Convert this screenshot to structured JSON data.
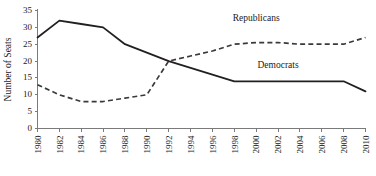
{
  "chart_data": {
    "type": "line",
    "title": "",
    "xlabel": "",
    "ylabel": "Number of Seats",
    "ylim": [
      0,
      35
    ],
    "ytick_step": 5,
    "yticks": [
      "0",
      "5",
      "10",
      "15",
      "20",
      "25",
      "30",
      "35"
    ],
    "grid": false,
    "legend_position": "inline-annotation",
    "categories": [
      "1980",
      "1982",
      "1984",
      "1986",
      "1988",
      "1990",
      "1992",
      "1994",
      "1996",
      "1998",
      "2000",
      "2002",
      "2004",
      "2006",
      "2008",
      "2010"
    ],
    "series": [
      {
        "name": "Democrats",
        "style": "solid",
        "color": "#231f20",
        "values": [
          27,
          32,
          31,
          30,
          25,
          22.5,
          20,
          18,
          16,
          14,
          14,
          14,
          14,
          14,
          14,
          11
        ]
      },
      {
        "name": "Republicans",
        "style": "dashed",
        "color": "#3a3a3a",
        "values": [
          13,
          10,
          8,
          8,
          9,
          10,
          20,
          21.5,
          23,
          25,
          25.5,
          25.5,
          25,
          25,
          25,
          27
        ]
      }
    ],
    "annotations": [
      {
        "text": "Republicans",
        "x_value": "2000",
        "y_value": 32
      },
      {
        "text": "Democrats",
        "x_value": "2002",
        "y_value": 18
      }
    ]
  },
  "axes": {
    "y_axis_title": "Number of Seats"
  }
}
